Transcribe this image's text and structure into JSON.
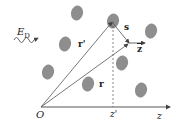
{
  "figure": {
    "type": "scattering-geometry-diagram",
    "labels": {
      "field": "E",
      "field_sub": "D",
      "origin": "O",
      "r_prime": "r'",
      "r": "r",
      "s": "s",
      "z_hat": "z",
      "z_prime": "z'",
      "z_axis": "z"
    },
    "colors": {
      "blob": "#8e8e8e",
      "line": "#444444",
      "text": "#222222"
    },
    "blobs": [
      {
        "cx": 77,
        "cy": 13
      },
      {
        "cx": 113,
        "cy": 21
      },
      {
        "cx": 151,
        "cy": 31
      },
      {
        "cx": 65,
        "cy": 44
      },
      {
        "cx": 48,
        "cy": 72
      },
      {
        "cx": 122,
        "cy": 63
      },
      {
        "cx": 88,
        "cy": 84
      },
      {
        "cx": 141,
        "cy": 90
      }
    ]
  }
}
